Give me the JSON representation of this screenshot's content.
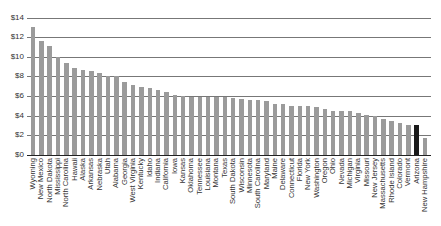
{
  "chart_data": {
    "type": "bar",
    "title": "",
    "xlabel": "",
    "ylabel": "",
    "ylim": [
      0,
      14
    ],
    "yticks": [
      "$0",
      "$2",
      "$4",
      "$6",
      "$8",
      "$10",
      "$12",
      "$14"
    ],
    "grid": true,
    "legend": null,
    "bar_color": "#9b9b9b",
    "highlight_color": "#1a1a1a",
    "highlight_category": "Arizona",
    "categories": [
      "Wyoming",
      "New Mexico",
      "North Dakota",
      "Mississippi",
      "North Carolina",
      "Hawaii",
      "Alaska",
      "Arkansas",
      "Nebraska",
      "Utah",
      "Alabama",
      "Georgia",
      "West Virginia",
      "Kentucky",
      "Idaho",
      "Indiana",
      "California",
      "Iowa",
      "Kansas",
      "Oklahoma",
      "Tennessee",
      "Louisiana",
      "Montana",
      "Texas",
      "South Dakota",
      "Wisconsin",
      "Minnesota",
      "South Carolina",
      "Maryland",
      "Maine",
      "Delaware",
      "Connecticut",
      "Florida",
      "New York",
      "Washington",
      "Oregon",
      "Ohio",
      "Nevada",
      "Michigan",
      "Virginia",
      "Missouri",
      "New Jersey",
      "Massachusetts",
      "Rhode Island",
      "Colorado",
      "Vermont",
      "Arizona",
      "New Hampshire"
    ],
    "values": [
      13.0,
      11.6,
      11.1,
      9.95,
      9.4,
      8.85,
      8.7,
      8.55,
      8.3,
      8.05,
      8.0,
      7.4,
      7.15,
      6.95,
      6.85,
      6.65,
      6.45,
      6.15,
      6.0,
      5.95,
      5.95,
      5.95,
      5.95,
      5.9,
      5.8,
      5.75,
      5.65,
      5.6,
      5.45,
      5.2,
      5.2,
      5.0,
      5.0,
      5.0,
      4.85,
      4.65,
      4.5,
      4.5,
      4.45,
      4.3,
      4.05,
      3.95,
      3.7,
      3.45,
      3.25,
      3.1,
      3.05,
      1.75
    ]
  }
}
